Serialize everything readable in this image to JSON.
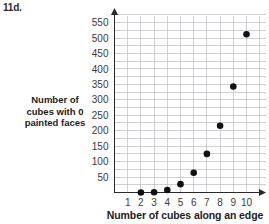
{
  "problem": {
    "number": "11d."
  },
  "chart_data": {
    "type": "scatter",
    "title": "",
    "xlabel": "Number of cubes along an edge",
    "ylabel_lines": [
      "Number of",
      "cubes with 0",
      "painted faces"
    ],
    "ylabel": "Number of cubes with 0 painted faces",
    "x": [
      2,
      3,
      4,
      5,
      6,
      7,
      8,
      9,
      10
    ],
    "values": [
      0,
      1,
      8,
      27,
      64,
      125,
      216,
      343,
      512
    ],
    "points": [
      {
        "x": 2,
        "y": 0
      },
      {
        "x": 3,
        "y": 1
      },
      {
        "x": 4,
        "y": 8
      },
      {
        "x": 5,
        "y": 27
      },
      {
        "x": 6,
        "y": 64
      },
      {
        "x": 7,
        "y": 125
      },
      {
        "x": 8,
        "y": 216
      },
      {
        "x": 9,
        "y": 343
      },
      {
        "x": 10,
        "y": 512
      }
    ],
    "xtick_labels": [
      "1",
      "2",
      "3",
      "4",
      "5",
      "6",
      "7",
      "8",
      "9",
      "10"
    ],
    "xticks": [
      1,
      2,
      3,
      4,
      5,
      6,
      7,
      8,
      9,
      10
    ],
    "ytick_labels": [
      "50",
      "100",
      "150",
      "200",
      "250",
      "300",
      "350",
      "400",
      "450",
      "500",
      "550"
    ],
    "yticks": [
      50,
      100,
      150,
      200,
      250,
      300,
      350,
      400,
      450,
      500,
      550
    ],
    "xlim": [
      0,
      11
    ],
    "ylim": [
      0,
      575
    ],
    "grid": true,
    "legend": "none",
    "marker": "filled-circle",
    "marker_color": "#111111",
    "grid_color": "#b9bcc4",
    "axis_color": "#2a2a2a",
    "background": "#ffffff"
  }
}
